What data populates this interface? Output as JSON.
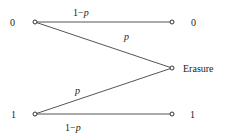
{
  "diagram": {
    "inputs": [
      {
        "label": "0"
      },
      {
        "label": "1"
      }
    ],
    "outputs": [
      {
        "label": "0"
      },
      {
        "label": "Erasure"
      },
      {
        "label": "1"
      }
    ],
    "edges": [
      {
        "from": "0",
        "to": "0",
        "label_prefix": "1−",
        "label_var": "p"
      },
      {
        "from": "0",
        "to": "Erasure",
        "label_var": "p"
      },
      {
        "from": "1",
        "to": "Erasure",
        "label_var": "p"
      },
      {
        "from": "1",
        "to": "1",
        "label_prefix": "1−",
        "label_var": "p"
      }
    ],
    "colors": {
      "line": "#555555",
      "text": "#222222",
      "background": "#ffffff"
    }
  }
}
